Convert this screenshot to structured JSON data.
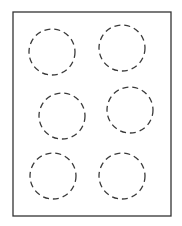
{
  "canvas": {
    "width": 182,
    "height": 226,
    "background": "#ffffff"
  },
  "frame": {
    "x": 13,
    "y": 12,
    "width": 158,
    "height": 204,
    "stroke": "#333333",
    "stroke_width": 1.3
  },
  "circle_style": {
    "stroke": "#3a3a3a",
    "stroke_width": 1.3,
    "dasharray": "6 4",
    "fill": "none"
  },
  "circles": [
    {
      "cx": 52,
      "cy": 52,
      "r": 23
    },
    {
      "cx": 122,
      "cy": 48,
      "r": 23
    },
    {
      "cx": 62,
      "cy": 116,
      "r": 23
    },
    {
      "cx": 130,
      "cy": 110,
      "r": 23
    },
    {
      "cx": 53,
      "cy": 176,
      "r": 23
    },
    {
      "cx": 122,
      "cy": 176,
      "r": 23
    }
  ]
}
